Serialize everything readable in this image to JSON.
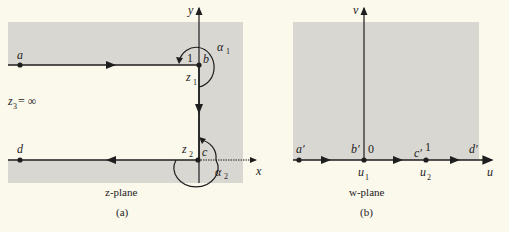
{
  "figure": {
    "panel_a": {
      "labels": {
        "a": "a",
        "b": "b",
        "c": "c",
        "d": "d",
        "one": "1",
        "z1": "z",
        "z1_sub": "1",
        "z2": "z",
        "z2_sub": "2",
        "alpha1": "α",
        "alpha1_sub": "1",
        "alpha2": "α",
        "alpha2_sub": "2",
        "z3": "z",
        "z3_sub": "3",
        "z3_eq": " = ∞",
        "x_axis": "x",
        "y_axis": "y"
      },
      "caption": "z-plane",
      "tag": "(a)"
    },
    "panel_b": {
      "labels": {
        "a_prime": "a′",
        "b_prime": "b′",
        "c_prime": "c′",
        "d_prime": "d′",
        "zero": "0",
        "one": "1",
        "u1": "u",
        "u1_sub": "1",
        "u2": "u",
        "u2_sub": "2",
        "u_axis": "u",
        "v_axis": "v"
      },
      "caption": "w-plane",
      "tag": "(b)"
    },
    "colors": {
      "background": "#fbf8ec",
      "shade": "#d9d7d2",
      "ink": "#1e1e1e"
    }
  }
}
